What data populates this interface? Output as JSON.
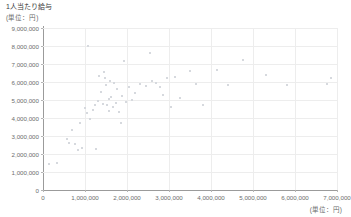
{
  "chart_data": {
    "type": "scatter",
    "title": "1人当たり給与",
    "unit_label_y": "(単位：円)",
    "unit_label_x": "(単位：円)",
    "xlabel": "",
    "ylabel": "",
    "xlim": [
      0,
      7000000
    ],
    "ylim": [
      0,
      9000000
    ],
    "grid": true,
    "legend": null,
    "x_ticks": [
      0,
      1000000,
      2000000,
      3000000,
      4000000,
      5000000,
      6000000,
      7000000
    ],
    "x_tick_labels": [
      "0",
      "1,000,000",
      "2,000,000",
      "3,000,000",
      "4,000,000",
      "5,000,000",
      "6,000,000",
      "7,000,000"
    ],
    "y_ticks": [
      0,
      1000000,
      2000000,
      3000000,
      4000000,
      5000000,
      6000000,
      7000000,
      8000000,
      9000000
    ],
    "y_tick_labels": [
      "0",
      "1,000,000",
      "2,000,000",
      "3,000,000",
      "4,000,000",
      "5,000,000",
      "6,000,000",
      "7,000,000",
      "8,000,000",
      "9,000,000"
    ],
    "marker_color": "#d6d9de",
    "gridline_color": "#ededed",
    "axis_color": "#9b9b9b",
    "points": [
      [
        150000,
        1450000
      ],
      [
        330000,
        1500000
      ],
      [
        560000,
        2850000
      ],
      [
        620000,
        2600000
      ],
      [
        700000,
        3350000
      ],
      [
        760000,
        2550000
      ],
      [
        840000,
        2250000
      ],
      [
        880000,
        3700000
      ],
      [
        940000,
        2350000
      ],
      [
        1010000,
        4550000
      ],
      [
        1050000,
        4300000
      ],
      [
        1080000,
        8000000
      ],
      [
        1120000,
        3950000
      ],
      [
        1180000,
        4450000
      ],
      [
        1230000,
        4750000
      ],
      [
        1260000,
        2300000
      ],
      [
        1300000,
        4950000
      ],
      [
        1340000,
        6350000
      ],
      [
        1380000,
        5450000
      ],
      [
        1420000,
        4800000
      ],
      [
        1450000,
        6550000
      ],
      [
        1470000,
        6250000
      ],
      [
        1500000,
        5850000
      ],
      [
        1530000,
        4700000
      ],
      [
        1560000,
        5050000
      ],
      [
        1580000,
        4400000
      ],
      [
        1600000,
        6050000
      ],
      [
        1630000,
        5150000
      ],
      [
        1660000,
        4600000
      ],
      [
        1700000,
        5950000
      ],
      [
        1730000,
        4850000
      ],
      [
        1760000,
        5600000
      ],
      [
        1800000,
        4350000
      ],
      [
        1850000,
        3750000
      ],
      [
        1880000,
        5250000
      ],
      [
        1930000,
        7150000
      ],
      [
        1980000,
        4900000
      ],
      [
        2050000,
        5750000
      ],
      [
        2120000,
        5000000
      ],
      [
        2200000,
        5400000
      ],
      [
        2300000,
        5900000
      ],
      [
        2450000,
        5800000
      ],
      [
        2550000,
        7600000
      ],
      [
        2600000,
        6050000
      ],
      [
        2700000,
        5950000
      ],
      [
        2780000,
        5700000
      ],
      [
        2850000,
        5300000
      ],
      [
        2950000,
        6250000
      ],
      [
        3050000,
        4600000
      ],
      [
        3150000,
        6300000
      ],
      [
        3250000,
        5100000
      ],
      [
        3500000,
        6600000
      ],
      [
        3650000,
        5900000
      ],
      [
        3800000,
        4700000
      ],
      [
        4150000,
        6650000
      ],
      [
        4400000,
        5850000
      ],
      [
        4750000,
        7200000
      ],
      [
        5300000,
        6400000
      ],
      [
        5800000,
        5850000
      ],
      [
        6750000,
        5900000
      ],
      [
        6850000,
        6200000
      ]
    ]
  }
}
